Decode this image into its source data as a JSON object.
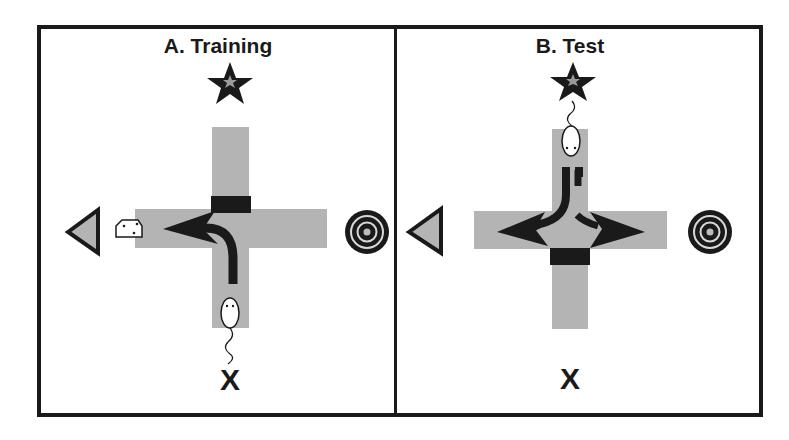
{
  "figure": {
    "panels": [
      {
        "id": "A",
        "title": "A. Training",
        "landmarks": {
          "north": "star",
          "south": "X",
          "west": "triangle",
          "east": "bullseye"
        },
        "reward": "cheese (west arm)",
        "blocked_arm": "north",
        "start_arm": "south",
        "path": "left turn (to west)"
      },
      {
        "id": "B",
        "title": "B. Test",
        "landmarks": {
          "north": "star",
          "south": "X",
          "west": "triangle",
          "east": "bullseye"
        },
        "blocked_arm": "south",
        "start_arm": "north",
        "path": "choice: west (place) or east (response)"
      }
    ],
    "labels": {
      "south_marker": "X"
    },
    "colors": {
      "maze_arm": "#b4b4b4",
      "ink": "#1a1a1a",
      "background": "#ffffff"
    }
  }
}
